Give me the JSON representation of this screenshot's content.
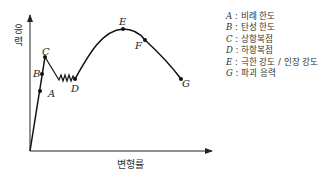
{
  "diagram": {
    "type": "stress-strain curve",
    "axes": {
      "y_label": "응력",
      "x_label": "변형률"
    },
    "points": [
      {
        "key": "A",
        "x": 40,
        "y": 91
      },
      {
        "key": "B",
        "x": 42,
        "y": 74
      },
      {
        "key": "C",
        "x": 45,
        "y": 57
      },
      {
        "key": "D",
        "x": 75,
        "y": 79
      },
      {
        "key": "E",
        "x": 123,
        "y": 29
      },
      {
        "key": "F",
        "x": 145,
        "y": 40
      },
      {
        "key": "G",
        "x": 181,
        "y": 79
      }
    ],
    "point_labels": {
      "A": "A",
      "B": "B",
      "C": "C",
      "D": "D",
      "E": "E",
      "F": "F",
      "G": "G"
    },
    "legend": [
      {
        "key": "A",
        "sep": " : ",
        "text": "비례 한도"
      },
      {
        "key": "B",
        "sep": " : ",
        "text": "탄성 한도"
      },
      {
        "key": "C",
        "sep": " : ",
        "text": "상항복점"
      },
      {
        "key": "D",
        "sep": " : ",
        "text": "하항복점"
      },
      {
        "key": "E",
        "sep": " : ",
        "text": "극한 강도 / 인장 강도"
      },
      {
        "key": "G",
        "sep": " : ",
        "text": "파괴 응력"
      }
    ],
    "colors": {
      "line": "#111111",
      "axis": "#222222"
    }
  }
}
